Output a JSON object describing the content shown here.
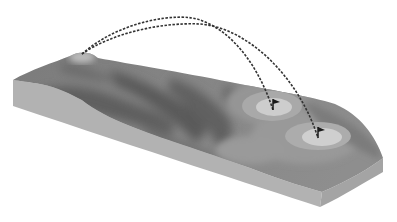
{
  "illustration": {
    "subject": "golf-hole-terrain-block",
    "colors": {
      "background": "#ffffff",
      "side_face": "#b4b4b4",
      "side_face_front": "#a9a9a9",
      "fairway_dark": "#6e6e6e",
      "fairway_mid": "#868686",
      "rough_light": "#9a9a9a",
      "green_outer": "#a8a8a8",
      "green_inner": "#cfcfcf",
      "tee": "#c2c2c2",
      "trajectory": "#333333",
      "flag": "#1a1a1a"
    },
    "elements": {
      "tee": {
        "x": 82,
        "y": 53
      },
      "greens": [
        {
          "name": "green-1",
          "flag_x": 273,
          "flag_y": 103
        },
        {
          "name": "green-2",
          "flag_x": 318,
          "flag_y": 131
        }
      ],
      "trajectories": [
        {
          "from": "tee",
          "to": "green-1"
        },
        {
          "from": "tee",
          "to": "green-2"
        }
      ]
    }
  }
}
